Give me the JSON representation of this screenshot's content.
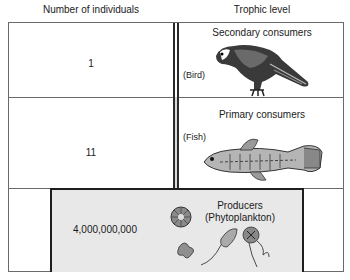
{
  "headers": {
    "left": "Number of individuals",
    "right": "Trophic level"
  },
  "rows": [
    {
      "count": "1",
      "level": "Secondary  consumers",
      "organism": "(Bird)",
      "icon": "bird-icon"
    },
    {
      "count": "11",
      "level": "Primary consumers",
      "organism": "(Fish)",
      "icon": "fish-icon"
    },
    {
      "count": "4,000,000,000",
      "level": "Producers",
      "organism": "(Phytoplankton)",
      "icon": "phytoplankton-icon"
    }
  ],
  "colors": {
    "producer_fill": "#e8e8e8",
    "divider_fill": "#d9d9d9",
    "border": "#1e1e1e"
  }
}
